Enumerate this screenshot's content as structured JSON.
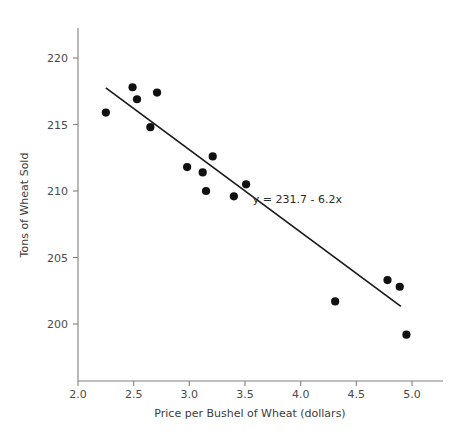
{
  "chart_data": {
    "type": "scatter",
    "title": "",
    "xlabel": "Price per Bushel of Wheat (dollars)",
    "ylabel": "Tons of Wheat Sold",
    "xlim": [
      1.93,
      5.22
    ],
    "ylim": [
      197.2,
      221.9
    ],
    "xticks": [
      2.0,
      2.5,
      3.0,
      3.5,
      4.0,
      4.5,
      5.0
    ],
    "xticklabels": [
      "2.0",
      "2.5",
      "3.0",
      "3.5",
      "4.0",
      "4.5",
      "5.0"
    ],
    "yticks": [
      200,
      205,
      210,
      215,
      220
    ],
    "yticklabels": [
      "200",
      "205",
      "210",
      "215",
      "220"
    ],
    "grid": false,
    "legend": null,
    "marker_color": "#111111",
    "line_color": "#1a1a1a",
    "x": [
      2.25,
      2.49,
      2.53,
      2.65,
      2.71,
      2.98,
      3.12,
      3.15,
      3.21,
      3.4,
      3.51,
      4.31,
      4.78,
      4.89,
      4.95
    ],
    "y": [
      215.9,
      217.8,
      216.9,
      214.8,
      217.4,
      211.8,
      211.4,
      210.0,
      212.6,
      209.6,
      210.5,
      201.7,
      203.3,
      202.8,
      199.2
    ],
    "points": [
      {
        "x": 2.25,
        "y": 215.9
      },
      {
        "x": 2.49,
        "y": 217.8
      },
      {
        "x": 2.53,
        "y": 216.9
      },
      {
        "x": 2.65,
        "y": 214.8
      },
      {
        "x": 2.71,
        "y": 217.4
      },
      {
        "x": 2.98,
        "y": 211.8
      },
      {
        "x": 3.12,
        "y": 211.4
      },
      {
        "x": 3.15,
        "y": 210.0
      },
      {
        "x": 3.21,
        "y": 212.6
      },
      {
        "x": 3.4,
        "y": 209.6
      },
      {
        "x": 3.51,
        "y": 210.5
      },
      {
        "x": 4.31,
        "y": 201.7
      },
      {
        "x": 4.78,
        "y": 203.3
      },
      {
        "x": 4.89,
        "y": 202.8
      },
      {
        "x": 4.95,
        "y": 199.2
      }
    ],
    "trendline": {
      "intercept": 231.7,
      "slope": -6.2,
      "x_start": 2.25,
      "x_end": 4.9,
      "annotation": "y = 231.7 - 6.2x",
      "annotation_x": 3.57,
      "annotation_y": 209.1
    }
  }
}
